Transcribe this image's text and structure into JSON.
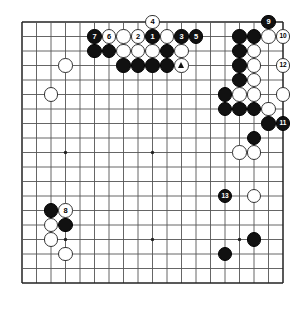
{
  "diagram": {
    "kind": "go-board-diagram",
    "board_size": 19,
    "geometry": {
      "origin_x": 22,
      "origin_y": 22,
      "spacing": 14.5,
      "stone_radius": 7.2,
      "line_color": "#555555",
      "border_color": "#222222",
      "board_color": "#ffffff",
      "star_points": [
        [
          3,
          3
        ],
        [
          9,
          3
        ],
        [
          15,
          3
        ],
        [
          3,
          9
        ],
        [
          9,
          9
        ],
        [
          15,
          9
        ],
        [
          3,
          15
        ],
        [
          9,
          15
        ],
        [
          15,
          15
        ]
      ]
    },
    "colors": {
      "black_stone": "#111111",
      "white_stone": "#ffffff",
      "black_label_text": "#ffffff",
      "white_label_text": "#000000",
      "white_outline": "#333333"
    },
    "stones": [
      {
        "id": "w-c3r3",
        "color": "white",
        "col": 3,
        "row": 3,
        "label": ""
      },
      {
        "id": "w-c2r5",
        "col": 2,
        "row": 5,
        "color": "white",
        "label": ""
      },
      {
        "id": "b-c5r1-num7",
        "color": "black",
        "col": 5,
        "row": 1,
        "label": "7"
      },
      {
        "id": "w-c6r1-num6",
        "color": "white",
        "col": 6,
        "row": 1,
        "label": "6"
      },
      {
        "id": "w-c7r1",
        "color": "white",
        "col": 7,
        "row": 1,
        "label": ""
      },
      {
        "id": "w-c8r1-num2",
        "color": "white",
        "col": 8,
        "row": 1,
        "label": "2"
      },
      {
        "id": "b-c9r1-num1",
        "color": "black",
        "col": 9,
        "row": 1,
        "label": "1"
      },
      {
        "id": "w-c10r1",
        "color": "white",
        "col": 10,
        "row": 1,
        "label": ""
      },
      {
        "id": "b-c11r1-num3",
        "color": "black",
        "col": 11,
        "row": 1,
        "label": "3"
      },
      {
        "id": "b-c12r1-num5",
        "color": "black",
        "col": 12,
        "row": 1,
        "label": "5"
      },
      {
        "id": "w-c9r0-num4",
        "color": "white",
        "col": 9,
        "row": 0,
        "label": "4"
      },
      {
        "id": "b-c5r2",
        "color": "black",
        "col": 5,
        "row": 2,
        "label": ""
      },
      {
        "id": "b-c6r2",
        "color": "black",
        "col": 6,
        "row": 2,
        "label": ""
      },
      {
        "id": "w-c7r2",
        "color": "white",
        "col": 7,
        "row": 2,
        "label": ""
      },
      {
        "id": "w-c8r2",
        "color": "white",
        "col": 8,
        "row": 2,
        "label": ""
      },
      {
        "id": "w-c9r2",
        "color": "white",
        "col": 9,
        "row": 2,
        "label": ""
      },
      {
        "id": "b-c10r2",
        "color": "black",
        "col": 10,
        "row": 2,
        "label": ""
      },
      {
        "id": "w-c11r2",
        "color": "white",
        "col": 11,
        "row": 2,
        "label": ""
      },
      {
        "id": "b-c7r3",
        "color": "black",
        "col": 7,
        "row": 3,
        "label": ""
      },
      {
        "id": "b-c8r3",
        "color": "black",
        "col": 8,
        "row": 3,
        "label": ""
      },
      {
        "id": "b-c9r3",
        "color": "black",
        "col": 9,
        "row": 3,
        "label": ""
      },
      {
        "id": "b-c10r3",
        "color": "black",
        "col": 10,
        "row": 3,
        "label": ""
      },
      {
        "id": "w-c11r3-tri",
        "color": "white",
        "col": 11,
        "row": 3,
        "label": "",
        "marker": "triangle"
      },
      {
        "id": "b-c17r0-num9",
        "color": "black",
        "col": 17,
        "row": 0,
        "label": "9"
      },
      {
        "id": "b-c15r1",
        "color": "black",
        "col": 15,
        "row": 1,
        "label": ""
      },
      {
        "id": "b-c16r1",
        "color": "black",
        "col": 16,
        "row": 1,
        "label": ""
      },
      {
        "id": "w-c17r1",
        "color": "white",
        "col": 17,
        "row": 1,
        "label": ""
      },
      {
        "id": "w-c18r1-num10",
        "color": "white",
        "col": 18,
        "row": 1,
        "label": "10"
      },
      {
        "id": "b-c15r2",
        "color": "black",
        "col": 15,
        "row": 2,
        "label": ""
      },
      {
        "id": "w-c16r2",
        "color": "white",
        "col": 16,
        "row": 2,
        "label": ""
      },
      {
        "id": "b-c15r3",
        "color": "black",
        "col": 15,
        "row": 3,
        "label": ""
      },
      {
        "id": "w-c16r3",
        "color": "white",
        "col": 16,
        "row": 3,
        "label": ""
      },
      {
        "id": "w-c18r3-num12",
        "color": "white",
        "col": 18,
        "row": 3,
        "label": "12"
      },
      {
        "id": "b-c15r4",
        "color": "black",
        "col": 15,
        "row": 4,
        "label": ""
      },
      {
        "id": "w-c16r4",
        "color": "white",
        "col": 16,
        "row": 4,
        "label": ""
      },
      {
        "id": "b-c14r5",
        "color": "black",
        "col": 14,
        "row": 5,
        "label": ""
      },
      {
        "id": "w-c15r5",
        "color": "white",
        "col": 15,
        "row": 5,
        "label": ""
      },
      {
        "id": "w-c16r5",
        "color": "white",
        "col": 16,
        "row": 5,
        "label": ""
      },
      {
        "id": "w-c18r5",
        "color": "white",
        "col": 18,
        "row": 5,
        "label": ""
      },
      {
        "id": "b-c14r6",
        "color": "black",
        "col": 14,
        "row": 6,
        "label": ""
      },
      {
        "id": "b-c15r6",
        "color": "black",
        "col": 15,
        "row": 6,
        "label": ""
      },
      {
        "id": "b-c16r6",
        "color": "black",
        "col": 16,
        "row": 6,
        "label": ""
      },
      {
        "id": "w-c17r6",
        "color": "white",
        "col": 17,
        "row": 6,
        "label": ""
      },
      {
        "id": "b-c17r7",
        "color": "black",
        "col": 17,
        "row": 7,
        "label": ""
      },
      {
        "id": "b-c18r7-num11",
        "color": "black",
        "col": 18,
        "row": 7,
        "label": "11"
      },
      {
        "id": "b-c16r8",
        "color": "black",
        "col": 16,
        "row": 8,
        "label": ""
      },
      {
        "id": "w-c15r9",
        "color": "white",
        "col": 15,
        "row": 9,
        "label": ""
      },
      {
        "id": "w-c16r9",
        "color": "white",
        "col": 16,
        "row": 9,
        "label": ""
      },
      {
        "id": "b-c14r12-num13",
        "color": "black",
        "col": 14,
        "row": 12,
        "label": "13"
      },
      {
        "id": "w-c16r12",
        "color": "white",
        "col": 16,
        "row": 12,
        "label": ""
      },
      {
        "id": "b-c2r13",
        "color": "black",
        "col": 2,
        "row": 13,
        "label": ""
      },
      {
        "id": "w-c3r13-num8",
        "color": "white",
        "col": 3,
        "row": 13,
        "label": "8"
      },
      {
        "id": "w-c2r14",
        "color": "white",
        "col": 2,
        "row": 14,
        "label": ""
      },
      {
        "id": "b-c3r14",
        "color": "black",
        "col": 3,
        "row": 14,
        "label": ""
      },
      {
        "id": "w-c2r15",
        "color": "white",
        "col": 2,
        "row": 15,
        "label": ""
      },
      {
        "id": "w-c3r16",
        "color": "white",
        "col": 3,
        "row": 16,
        "label": ""
      },
      {
        "id": "b-c16r15",
        "color": "black",
        "col": 16,
        "row": 15,
        "label": ""
      },
      {
        "id": "b-c14r16",
        "color": "black",
        "col": 14,
        "row": 16,
        "label": ""
      }
    ],
    "move_numbers": [
      "1",
      "2",
      "3",
      "4",
      "5",
      "6",
      "7",
      "8",
      "9",
      "10",
      "11",
      "12",
      "13"
    ]
  }
}
